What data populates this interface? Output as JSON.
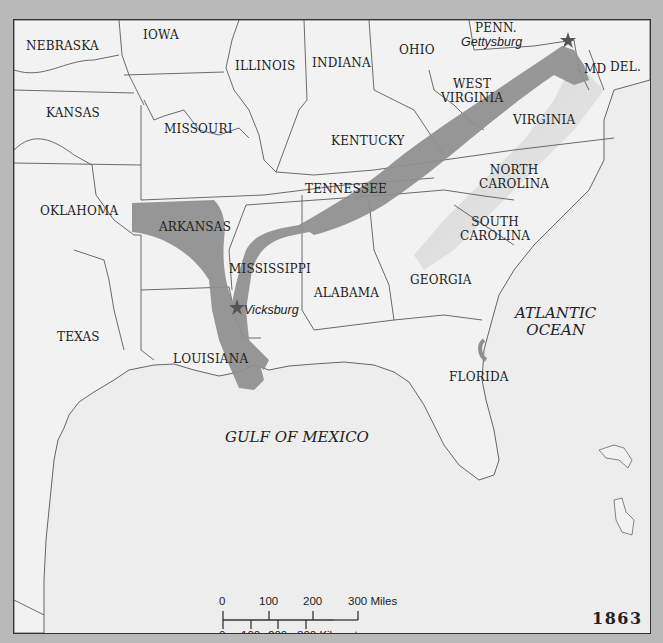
{
  "map": {
    "year": "1863",
    "states": [
      {
        "id": "nebraska",
        "label": "NEBRASKA",
        "x": 12,
        "y": 20
      },
      {
        "id": "iowa",
        "label": "IOWA",
        "x": 129,
        "y": 13
      },
      {
        "id": "illinois",
        "label": "ILLINOIS",
        "x": 221,
        "y": 42
      },
      {
        "id": "indiana",
        "label": "INDIANA",
        "x": 298,
        "y": 37
      },
      {
        "id": "ohio",
        "label": "OHIO",
        "x": 385,
        "y": 24
      },
      {
        "id": "penn",
        "label": "PENN.",
        "x": 461,
        "y": 3
      },
      {
        "id": "md",
        "label": "MD",
        "x": 570,
        "y": 43
      },
      {
        "id": "del",
        "label": "DEL.",
        "x": 596,
        "y": 41
      },
      {
        "id": "west-virginia",
        "label": "WEST\nVIRGINIA",
        "x": 427,
        "y": 59
      },
      {
        "id": "virginia",
        "label": "VIRGINIA",
        "x": 499,
        "y": 94
      },
      {
        "id": "kansas",
        "label": "KANSAS",
        "x": 32,
        "y": 87
      },
      {
        "id": "missouri",
        "label": "MISSOURI",
        "x": 150,
        "y": 103
      },
      {
        "id": "kentucky",
        "label": "KENTUCKY",
        "x": 317,
        "y": 115
      },
      {
        "id": "tennessee",
        "label": "TENNESSEE",
        "x": 291,
        "y": 164
      },
      {
        "id": "north-carolina",
        "label": "NORTH\nCAROLINA",
        "x": 465,
        "y": 145
      },
      {
        "id": "oklahoma",
        "label": "OKLAHOMA",
        "x": 26,
        "y": 186
      },
      {
        "id": "arkansas",
        "label": "ARKANSAS",
        "x": 145,
        "y": 202
      },
      {
        "id": "south-carolina",
        "label": "SOUTH\nCAROLINA",
        "x": 444,
        "y": 196
      },
      {
        "id": "mississippi",
        "label": "MISSISSIPPI",
        "x": 215,
        "y": 243
      },
      {
        "id": "alabama",
        "label": "ALABAMA",
        "x": 300,
        "y": 267
      },
      {
        "id": "georgia",
        "label": "GEORGIA",
        "x": 396,
        "y": 254
      },
      {
        "id": "texas",
        "label": "TEXAS",
        "x": 43,
        "y": 311
      },
      {
        "id": "louisiana",
        "label": "LOUISIANA",
        "x": 159,
        "y": 334
      },
      {
        "id": "florida",
        "label": "FLORIDA",
        "x": 435,
        "y": 352
      }
    ],
    "cities": [
      {
        "id": "gettysburg",
        "label": "Gettysburg",
        "x": 448,
        "y": 21,
        "marker_x": 554,
        "marker_y": 20
      },
      {
        "id": "vicksburg",
        "label": "Vicksburg",
        "x": 228,
        "y": 285,
        "marker_x": 223,
        "marker_y": 287
      }
    ],
    "water_bodies": [
      {
        "id": "atlantic-ocean",
        "label": "ATLANTIC\nOCEAN",
        "x": 502,
        "y": 286
      },
      {
        "id": "gulf-of-mexico",
        "label": "GULF OF MEXICO",
        "x": 211,
        "y": 409
      }
    ],
    "scale_bar": {
      "miles_ticks": [
        "0",
        "100",
        "200",
        "300 Miles"
      ],
      "km_ticks": [
        "0",
        "100",
        "200",
        "300 Kilometers"
      ]
    },
    "colors": {
      "background": "#ededed",
      "frame": "#b9b9b9",
      "campaign_band": "#8f8f8f",
      "border_lines": "#5a5a5a",
      "text": "#222222"
    }
  }
}
